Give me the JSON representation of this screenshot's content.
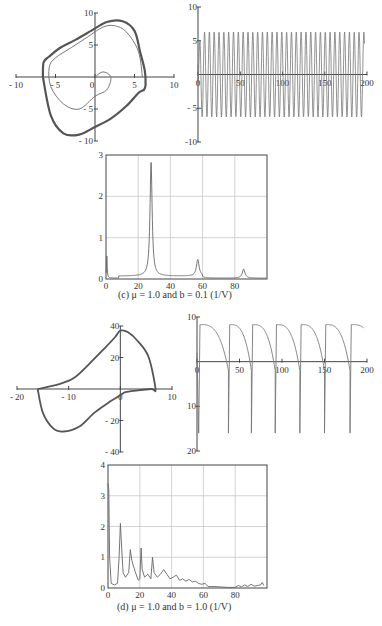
{
  "figure": {
    "panel_c": {
      "caption": "(c) μ = 1.0 and b = 0.1 (1/V)",
      "phase": {
        "xticks": [
          "- 10",
          "- 5",
          "0",
          "5",
          "10"
        ],
        "yticks": [
          "10",
          "5",
          "- 5",
          "- 10"
        ]
      },
      "timeseries": {
        "xticks": [
          "0",
          "50",
          "100",
          "150",
          "200"
        ],
        "yticks": [
          "10",
          "5",
          "- 5",
          "-10"
        ]
      },
      "spectrum": {
        "xticks": [
          "0",
          "20",
          "40",
          "60",
          "80"
        ],
        "yticks": [
          "3",
          "2",
          "1",
          "0"
        ]
      }
    },
    "panel_d": {
      "caption": "(d) μ = 1.0 and b = 1.0 (1/V)",
      "phase": {
        "xticks": [
          "- 20",
          "- 10",
          "0",
          "10"
        ],
        "yticks": [
          "40",
          "20",
          "- 20",
          "- 40"
        ]
      },
      "timeseries": {
        "xticks": [
          "0",
          "50",
          "100",
          "150",
          "200"
        ],
        "yticks": [
          "10",
          "10",
          "20"
        ]
      },
      "spectrum": {
        "xticks": [
          "0",
          "20",
          "40",
          "60",
          "80"
        ],
        "yticks": [
          "4",
          "3",
          "2",
          "1",
          "0"
        ]
      }
    }
  },
  "chart_data": [
    {
      "type": "scatter",
      "title": "Phase portrait (c)",
      "xlim": [
        -10,
        10
      ],
      "ylim": [
        -10,
        10
      ],
      "xticks": [
        -10,
        -5,
        0,
        5,
        10
      ],
      "yticks": [
        -10,
        -5,
        0,
        5,
        10
      ],
      "series": [
        {
          "name": "limit cycle",
          "x": [
            -6.6,
            -6.5,
            -5.8,
            -4.5,
            -2.5,
            -0.5,
            1.5,
            3.5,
            5.0,
            5.7,
            6.3,
            6.4,
            6.2,
            5.5,
            4.0,
            2.0,
            0,
            -2,
            -4,
            -5.6,
            -6.6
          ],
          "y": [
            0,
            2.3,
            3.2,
            4.5,
            5.8,
            7.2,
            8.6,
            8.7,
            7.2,
            4.0,
            1.0,
            -1.2,
            -2.0,
            -2.5,
            -4.5,
            -6.5,
            -7.8,
            -9.0,
            -8.8,
            -6.0,
            0
          ]
        },
        {
          "name": "transient",
          "x": [
            0,
            1,
            2,
            1.5,
            0,
            -2,
            -4,
            -5.6,
            -5.8,
            -5,
            -3,
            -1,
            1,
            2.5,
            4,
            5.5,
            6
          ],
          "y": [
            0,
            0.8,
            0,
            -2,
            -3,
            -5,
            -4.2,
            -1.5,
            1.5,
            3,
            4.6,
            6.2,
            7.8,
            8.0,
            7,
            4,
            0
          ]
        }
      ]
    },
    {
      "type": "line",
      "title": "Time series (c)",
      "xlim": [
        0,
        200
      ],
      "ylim": [
        -10,
        10
      ],
      "xticks": [
        0,
        50,
        100,
        150,
        200
      ],
      "yticks": [
        -10,
        -5,
        0,
        5,
        10
      ],
      "amplitude": 6.3,
      "cycles": 35
    },
    {
      "type": "line",
      "title": "Spectrum (c)",
      "xlim": [
        0,
        100
      ],
      "ylim": [
        0,
        3
      ],
      "xticks": [
        0,
        20,
        40,
        60,
        80
      ],
      "yticks": [
        0,
        1,
        2,
        3
      ],
      "grid": true,
      "peaks": [
        {
          "x": 0.5,
          "y": 0.62
        },
        {
          "x": 28,
          "y": 2.75
        },
        {
          "x": 57,
          "y": 0.4
        },
        {
          "x": 85.5,
          "y": 0.22
        }
      ]
    },
    {
      "type": "scatter",
      "title": "Phase portrait (d)",
      "xlim": [
        -20,
        10
      ],
      "ylim": [
        -40,
        40
      ],
      "xticks": [
        -20,
        -10,
        0,
        10
      ],
      "yticks": [
        -40,
        -20,
        0,
        20,
        40
      ],
      "series": [
        {
          "name": "limit cycle",
          "x": [
            -16,
            -12,
            -9,
            -6,
            -3,
            -1,
            0,
            1.5,
            3.5,
            5.5,
            6.8,
            6,
            3,
            1,
            0,
            -2,
            -5,
            -8,
            -11,
            -13,
            -15,
            -16
          ],
          "y": [
            0,
            3,
            7,
            16,
            26,
            33,
            37,
            36,
            30,
            20,
            0,
            0,
            -1,
            -2,
            -4,
            -8,
            -15,
            -24,
            -27,
            -25,
            -15,
            0
          ]
        }
      ]
    },
    {
      "type": "line",
      "title": "Time series (d)",
      "xlim": [
        0,
        200
      ],
      "ylim": [
        -20,
        10
      ],
      "xticks": [
        0,
        50,
        100,
        150,
        200
      ],
      "yticks": [
        -20,
        -10,
        0,
        10
      ],
      "max": 8.3,
      "min": -16,
      "spike_times": [
        37,
        64,
        92,
        121,
        150,
        180
      ]
    },
    {
      "type": "line",
      "title": "Spectrum (d)",
      "xlim": [
        0,
        100
      ],
      "ylim": [
        0,
        4
      ],
      "xticks": [
        0,
        20,
        40,
        60,
        80
      ],
      "yticks": [
        0,
        1,
        2,
        3,
        4
      ],
      "grid": true,
      "x": [
        0,
        0.5,
        1,
        2,
        4,
        6,
        7,
        7.8,
        8.5,
        9.5,
        11,
        13,
        14,
        15,
        17,
        19,
        20,
        20.8,
        21.5,
        23,
        25,
        27,
        28,
        29,
        31,
        33,
        35,
        37,
        39,
        41,
        43,
        45,
        47,
        49,
        51,
        53,
        55,
        57,
        59,
        61,
        63,
        65,
        67,
        70,
        75,
        80,
        82,
        84,
        86,
        88,
        90,
        92,
        94,
        96,
        97,
        98
      ],
      "y": [
        3.4,
        3.2,
        1.0,
        0.15,
        0.1,
        0.15,
        1.0,
        2.1,
        1.4,
        0.5,
        0.35,
        0.5,
        1.25,
        0.9,
        0.55,
        0.25,
        0.3,
        1.3,
        0.6,
        0.35,
        0.45,
        0.3,
        1.0,
        0.5,
        0.35,
        0.45,
        0.6,
        0.45,
        0.3,
        0.35,
        0.42,
        0.25,
        0.3,
        0.22,
        0.28,
        0.2,
        0.22,
        0.15,
        0.12,
        0.15,
        0.05,
        0.05,
        0.05,
        0.04,
        0.02,
        0.02,
        0.08,
        0.04,
        0.1,
        0.05,
        0.12,
        0.06,
        0.08,
        0.1,
        0.18,
        0.08
      ]
    }
  ]
}
